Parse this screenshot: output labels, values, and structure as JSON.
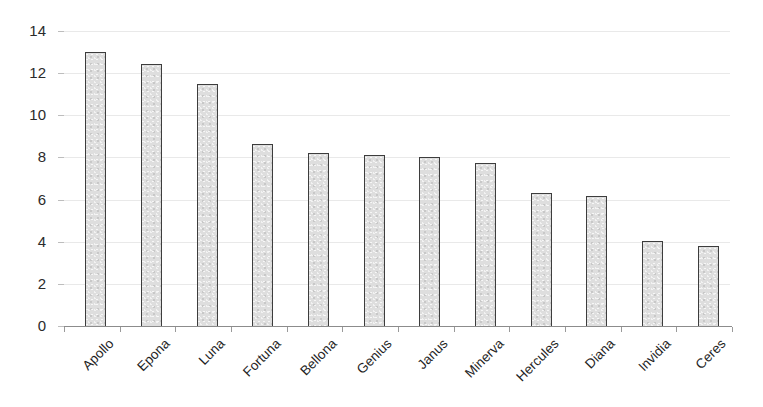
{
  "chart_data": {
    "type": "bar",
    "title": "",
    "subtitle": "",
    "xlabel": "",
    "ylabel": "",
    "ylim": [
      0,
      14
    ],
    "yticks": [
      0,
      2,
      4,
      6,
      8,
      10,
      12,
      14
    ],
    "ytick_labels": [
      "0",
      "2",
      "4",
      "6",
      "8",
      "10",
      "12",
      "14"
    ],
    "grid": true,
    "legend": false,
    "legend_position": "none",
    "orientation": "vertical",
    "sorted": "descending",
    "categories": [
      "Apollo",
      "Epona",
      "Luna",
      "Fortuna",
      "Bellona",
      "Genius",
      "Janus",
      "Minerva",
      "Hercules",
      "Diana",
      "Invidia",
      "Ceres"
    ],
    "values": [
      13.0,
      12.45,
      11.5,
      8.65,
      8.2,
      8.1,
      8.0,
      7.75,
      6.3,
      6.15,
      4.05,
      3.8
    ],
    "colors": {
      "bar_fill": "#dedede",
      "bar_border": "#3d3d3d",
      "gridline": "#e9e9e9",
      "axis_line": "#8c8c8c",
      "tick_label": "#2b2b2b",
      "category_label": "#1f1f1f",
      "background": "#ffffff"
    }
  }
}
